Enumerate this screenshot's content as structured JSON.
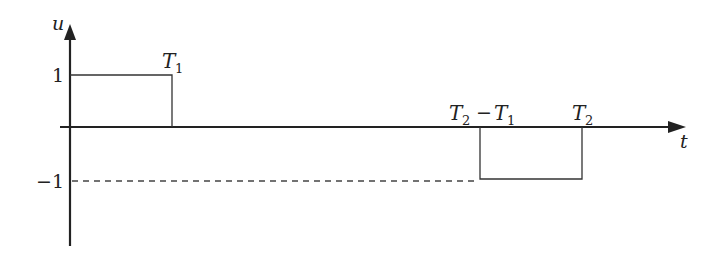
{
  "diagram": {
    "axes": {
      "y_label": "u",
      "x_label": "t"
    },
    "levels": {
      "positive": "1",
      "negative": "−1"
    },
    "time_marks": {
      "t1": {
        "base": "T",
        "sub": "1"
      },
      "t2_minus_t1": {
        "base1": "T",
        "sub1": "2",
        "op": "−",
        "base2": "T",
        "sub2": "1"
      },
      "t2": {
        "base": "T",
        "sub": "2"
      }
    },
    "pulses": [
      {
        "name": "positive-pulse",
        "from": "0",
        "to": "T1",
        "value": 1
      },
      {
        "name": "negative-pulse",
        "from": "T2 - T1",
        "to": "T2",
        "value": -1
      }
    ],
    "colors": {
      "line": "#222222",
      "dashed": "#444444"
    }
  }
}
